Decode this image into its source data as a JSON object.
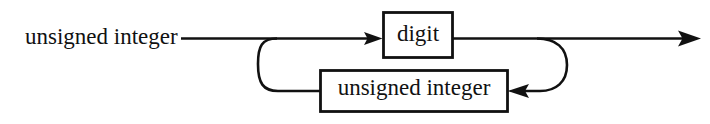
{
  "diagram": {
    "kind": "railroad-syntax-diagram",
    "title": "unsigned integer",
    "rule_name": "unsigned integer",
    "colors": {
      "background": "#ffffff",
      "line": "#111111",
      "box_fill": "#ffffff",
      "box_stroke": "#111111",
      "text": "#111111"
    },
    "entry": {
      "label": "unsigned integer",
      "name": "rule-name-label"
    },
    "nodes": [
      {
        "id": "digit",
        "label": "digit",
        "type": "terminal-box",
        "row": "upper"
      },
      {
        "id": "unsigned-integer",
        "label": "unsigned integer",
        "type": "nonterminal-box",
        "row": "lower"
      }
    ],
    "arrows": [
      {
        "name": "arrow-into-digit",
        "direction": "right"
      },
      {
        "name": "arrow-into-unsigned-integer",
        "direction": "left"
      },
      {
        "name": "arrow-exit",
        "direction": "right"
      }
    ],
    "loops": [
      {
        "name": "left-loop",
        "side": "left"
      },
      {
        "name": "right-loop",
        "side": "right"
      }
    ]
  }
}
